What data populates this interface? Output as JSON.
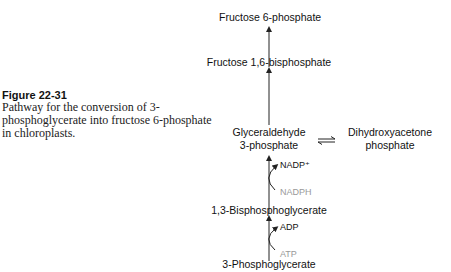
{
  "caption": {
    "label": "Figure 22-31",
    "text": "Pathway for the conversion of 3-phosphoglycerate into fructose 6-phosphate in chloroplasts."
  },
  "pathway": {
    "nodes": {
      "fructose_6p": "Fructose 6-phosphate",
      "fructose_16bp": "Fructose 1,6-bisphosphate",
      "g3p_line1": "Glyceraldehyde",
      "g3p_line2": "3-phosphate",
      "dhap_line1": "Dihydroxyacetone",
      "dhap_line2": "phosphate",
      "bpg": "1,3-Bisphosphoglycerate",
      "pg3": "3-Phosphoglycerate"
    },
    "cofactors": {
      "nadp": "NADP⁺",
      "nadph": "NADPH",
      "adp": "ADP",
      "atp": "ATP"
    },
    "colors": {
      "product_cofactor": "#111111",
      "reactant_cofactor": "#999999"
    }
  }
}
